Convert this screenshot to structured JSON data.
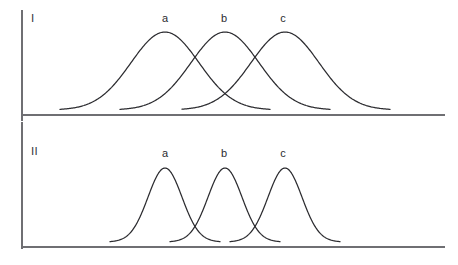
{
  "figure": {
    "background_color": "#ffffff",
    "axis_color": "#6f6f73",
    "curve_color": "#2c2c30",
    "label_color": "#2b2b2f",
    "width": 458,
    "height": 265
  },
  "panels": [
    {
      "id": "panel-I",
      "label": "I",
      "label_x": 31,
      "label_y": 22,
      "description": "Three broad overlapping Gaussian curves with wide standard deviation, peaks of equal height, curves overlap substantially and intersect near half-maximum",
      "axis": {
        "vertical": {
          "x": 22,
          "y_top": 10,
          "y_bottom": 121
        },
        "horizontal": {
          "y": 115,
          "x_left": 22,
          "x_right": 445
        }
      },
      "curves": [
        {
          "label": "a",
          "peak_x": 165,
          "peak_y": 32,
          "baseline_y": 110,
          "start_x": 60,
          "end_x": 270,
          "sigma": 34,
          "label_x": 165,
          "label_y": 22
        },
        {
          "label": "b",
          "peak_x": 225,
          "peak_y": 32,
          "baseline_y": 110,
          "start_x": 120,
          "end_x": 330,
          "sigma": 34,
          "label_x": 224,
          "label_y": 22
        },
        {
          "label": "c",
          "peak_x": 285,
          "peak_y": 32,
          "baseline_y": 110,
          "start_x": 182,
          "end_x": 390,
          "sigma": 34,
          "label_x": 283,
          "label_y": 22
        }
      ]
    },
    {
      "id": "panel-II",
      "label": "II",
      "label_x": 31,
      "label_y": 155,
      "description": "Three narrow Gaussian curves with small standard deviation, peaks of equal height, curves barely overlap and intersect only near the baseline tails",
      "axis": {
        "vertical": {
          "x": 22,
          "y_top": 122,
          "y_bottom": 249
        },
        "horizontal": {
          "y": 247,
          "x_left": 22,
          "x_right": 445
        }
      },
      "curves": [
        {
          "label": "a",
          "peak_x": 165,
          "peak_y": 168,
          "baseline_y": 242,
          "start_x": 110,
          "end_x": 220,
          "sigma": 17,
          "label_x": 165,
          "label_y": 157
        },
        {
          "label": "b",
          "peak_x": 225,
          "peak_y": 168,
          "baseline_y": 242,
          "start_x": 170,
          "end_x": 280,
          "sigma": 17,
          "label_x": 224,
          "label_y": 157
        },
        {
          "label": "c",
          "peak_x": 285,
          "peak_y": 168,
          "baseline_y": 242,
          "start_x": 230,
          "end_x": 340,
          "sigma": 17,
          "label_x": 283,
          "label_y": 157
        }
      ]
    }
  ],
  "chart_data": {
    "type": "line",
    "title": "",
    "xlabel": "",
    "ylabel": "",
    "grid": false,
    "legend_position": "none",
    "annotations": [
      "I",
      "II",
      "a",
      "b",
      "c",
      "a",
      "b",
      "c"
    ],
    "panels": [
      {
        "name": "I",
        "note": "Broad distributions — large spread, heavy overlap between a, b and c",
        "series": [
          {
            "name": "a",
            "mean": 165,
            "sigma": 34,
            "amplitude": 78
          },
          {
            "name": "b",
            "mean": 225,
            "sigma": 34,
            "amplitude": 78
          },
          {
            "name": "c",
            "mean": 285,
            "sigma": 34,
            "amplitude": 78
          }
        ]
      },
      {
        "name": "II",
        "note": "Narrow distributions — small spread, minimal overlap between a, b and c",
        "series": [
          {
            "name": "a",
            "mean": 165,
            "sigma": 17,
            "amplitude": 74
          },
          {
            "name": "b",
            "mean": 225,
            "sigma": 17,
            "amplitude": 74
          },
          {
            "name": "c",
            "mean": 285,
            "sigma": 17,
            "amplitude": 74
          }
        ]
      }
    ]
  }
}
